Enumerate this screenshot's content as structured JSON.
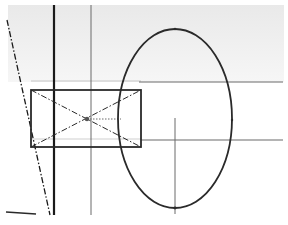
{
  "diagram": {
    "title": "",
    "colors": {
      "background": "#ffffff",
      "shade": "#ececec",
      "heavy_line": "#1a1a1a",
      "medium_line": "#3a3a3a",
      "light_line": "#8a8a8a",
      "faint_line": "#c4c4c4"
    },
    "elements": {
      "shaded_band": {
        "x": 8,
        "y": 5,
        "w": 276,
        "h": 77
      },
      "heavy_vertical": {
        "x": 54,
        "y1": 5,
        "y2": 215
      },
      "thin_vertical": {
        "x": 91,
        "y1": 5,
        "y2": 215
      },
      "dash_dot_diagonal": {
        "x1": 7,
        "y1": 20,
        "x2": 50,
        "y2": 215
      },
      "ground_line": {
        "x1": 6,
        "y1": 212,
        "x2": 36,
        "y2": 214
      },
      "rectangle": {
        "x": 31,
        "y": 90,
        "w": 110,
        "h": 57
      },
      "rect_center": {
        "x": 87,
        "y": 119
      },
      "top_reference_line": {
        "x1": 31,
        "y1": 81,
        "x2": 283,
        "y2": 81
      },
      "lower_reference_line": {
        "x1": 31,
        "y1": 139,
        "x2": 283,
        "y2": 139
      },
      "ellipse": {
        "cx": 175,
        "cy": 118.5,
        "rx": 57,
        "ry": 89.5
      },
      "ellipse_axis_vertical": {
        "x": 175,
        "y1": 118,
        "y2": 214
      },
      "center_dotted_line": {
        "x1": 87,
        "y1": 119,
        "x2": 121,
        "y2": 119
      }
    }
  }
}
